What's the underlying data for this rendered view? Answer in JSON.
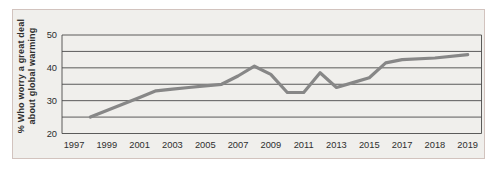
{
  "figure": {
    "colors": {
      "frame_bg": "#f0efec",
      "frame_border": "#d2c3be",
      "grid": "#4a4a4a",
      "line": "#878787",
      "text": "#2e2e2e"
    }
  },
  "chart_data": {
    "type": "line",
    "ylabel_lines": [
      "% Who worry a great deal",
      "about global warming"
    ],
    "ylabel": "% Who worry a great deal about global warming",
    "ylim": [
      20,
      50
    ],
    "y_ticks": [
      20,
      30,
      40,
      50
    ],
    "y_gridline_step": 5,
    "grid": true,
    "legend": false,
    "x_tick_labels": [
      "1997",
      "1999",
      "2001",
      "2003",
      "2005",
      "2007",
      "2009",
      "2011",
      "2013",
      "2015",
      "2017",
      "2018",
      "2019"
    ],
    "x_axis_note": "categorical: 2-year steps 1997-2017, then 1-year steps 2018-2019",
    "series": [
      {
        "x": [
          1998,
          1999,
          2000,
          2001,
          2002,
          2003,
          2004,
          2005,
          2006,
          2007,
          2008,
          2009,
          2010,
          2011,
          2012,
          2013,
          2014,
          2015,
          2016,
          2017,
          2018,
          2019
        ],
        "values": [
          25,
          27,
          29,
          31,
          33,
          33.5,
          34,
          34.5,
          35,
          37.5,
          40.5,
          38,
          32.5,
          32.5,
          38.5,
          34,
          35.5,
          37,
          41.5,
          42.5,
          43,
          44
        ]
      }
    ]
  }
}
